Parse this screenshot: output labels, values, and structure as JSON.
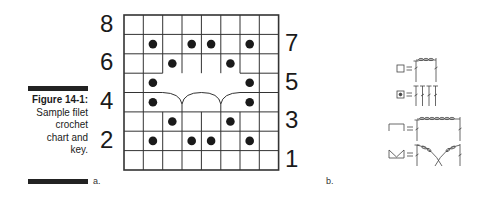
{
  "figure": {
    "number_label": "Figure 14-1:",
    "caption_lines": [
      "Sample filet",
      "crochet",
      "chart and",
      "key."
    ]
  },
  "panels": {
    "a_label": "a.",
    "b_label": "b."
  },
  "chart": {
    "rows": 8,
    "cols": 8,
    "left_row_numbers": [
      "8",
      "6",
      "4",
      "2"
    ],
    "right_row_numbers": [
      "7",
      "5",
      "3",
      "1"
    ],
    "filled_cells": [
      {
        "row": 7,
        "cols": [
          2,
          4,
          5,
          7
        ]
      },
      {
        "row": 6,
        "cols": [
          3,
          6
        ]
      },
      {
        "row": 5,
        "cols": [
          2,
          7
        ]
      },
      {
        "row": 4,
        "cols": [
          2,
          7
        ]
      },
      {
        "row": 3,
        "cols": [
          3,
          6
        ]
      },
      {
        "row": 2,
        "cols": [
          2,
          4,
          5,
          7
        ]
      }
    ],
    "lacet_rows": [
      4,
      5
    ],
    "lacet_cols": [
      3,
      6
    ]
  },
  "key": {
    "items": [
      {
        "symbol": "open-mesh",
        "equals": "=",
        "meaning": "chain-space mesh"
      },
      {
        "symbol": "filled-block",
        "equals": "=",
        "meaning": "block of stitches"
      },
      {
        "symbol": "bar",
        "equals": "=",
        "meaning": "bar (chain span)"
      },
      {
        "symbol": "lacet",
        "equals": "=",
        "meaning": "lacet"
      }
    ]
  }
}
